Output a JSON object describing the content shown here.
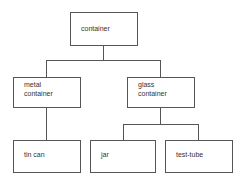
{
  "diagram": {
    "type": "hierarchy-tree",
    "nodes": {
      "root": {
        "label": "container"
      },
      "metal": {
        "label_line1": "metal",
        "label_line2": "container"
      },
      "glass": {
        "label_line1": "glass",
        "label_line2": "container"
      },
      "tin_can": {
        "label": "tin can"
      },
      "jar": {
        "label": "jar"
      },
      "test_tube": {
        "label": "test-tube"
      }
    },
    "edges": [
      [
        "container",
        "metal container"
      ],
      [
        "container",
        "glass container"
      ],
      [
        "metal container",
        "tin can"
      ],
      [
        "glass container",
        "jar"
      ],
      [
        "glass container",
        "test-tube"
      ]
    ]
  }
}
